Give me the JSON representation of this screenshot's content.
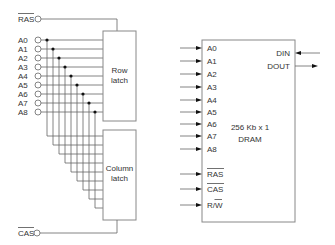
{
  "left_circuit": {
    "ras_label": "RAS",
    "cas_label": "CAS",
    "address_inputs": [
      "A0",
      "A1",
      "A2",
      "A3",
      "A4",
      "A5",
      "A6",
      "A7",
      "A8"
    ],
    "row_latch": {
      "line1": "Row",
      "line2": "latch"
    },
    "column_latch": {
      "line1": "Column",
      "line2": "latch"
    }
  },
  "dram_chip": {
    "title_line1": "256 Kb x 1",
    "title_line2": "DRAM",
    "address_pins": [
      "A0",
      "A1",
      "A2",
      "A3",
      "A4",
      "A5",
      "A6",
      "A7",
      "A8"
    ],
    "control_pins": [
      "RAS",
      "CAS",
      "R/W"
    ],
    "r_w_prefix": "R/",
    "r_w_suffix": "W",
    "data_in": "DIN",
    "data_out": "DOUT"
  },
  "colors": {
    "line": "#666666",
    "box_border": "#888888",
    "text": "#333333",
    "dot": "#111111"
  }
}
